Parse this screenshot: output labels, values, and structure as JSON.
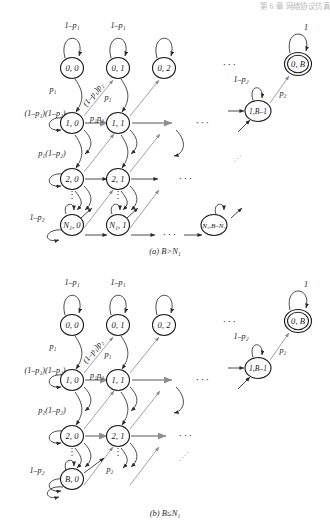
{
  "figure": {
    "header_text": "第 6 章   网络协议仿真",
    "type": "markov-chain-state-transition-diagram",
    "panels": [
      {
        "id": "a",
        "caption": "(a) B>N₁",
        "caption_plain": "(a) B>N1",
        "nodes": [
          {
            "id": "n00",
            "label": "0, 0",
            "kind": "normal"
          },
          {
            "id": "n01",
            "label": "0, 1",
            "kind": "normal"
          },
          {
            "id": "n02",
            "label": "0, 2",
            "kind": "normal"
          },
          {
            "id": "n10",
            "label": "1, 0",
            "kind": "normal"
          },
          {
            "id": "n11",
            "label": "1, 1",
            "kind": "normal"
          },
          {
            "id": "n20",
            "label": "2, 0",
            "kind": "normal"
          },
          {
            "id": "n21",
            "label": "2, 1",
            "kind": "normal"
          },
          {
            "id": "nN0",
            "label": "N₁, 0",
            "kind": "normal"
          },
          {
            "id": "nN1",
            "label": "N₁, 1",
            "kind": "normal"
          },
          {
            "id": "nNB",
            "label": "N₁,B–N₁",
            "kind": "normal"
          },
          {
            "id": "n0B",
            "label": "0, B",
            "kind": "absorbing"
          },
          {
            "id": "n1B",
            "label": "1,B–1",
            "kind": "normal"
          }
        ],
        "edge_labels": [
          {
            "id": "a-l1",
            "text": "1–p₁"
          },
          {
            "id": "a-l2",
            "text": "1–p₁"
          },
          {
            "id": "a-l3",
            "text": "p₁"
          },
          {
            "id": "a-l4",
            "text": "p₁"
          },
          {
            "id": "a-l5",
            "text": "(1–p₁)p₂"
          },
          {
            "id": "a-l6",
            "text": "(1–p₁)(1–p₂)"
          },
          {
            "id": "a-l7",
            "text": "p₁p₂"
          },
          {
            "id": "a-l8",
            "text": "p₁(1–p₂)"
          },
          {
            "id": "a-l9",
            "text": "1–p₂"
          },
          {
            "id": "a-l10",
            "text": "1"
          },
          {
            "id": "a-l11",
            "text": "1–p₂"
          },
          {
            "id": "a-l12",
            "text": "p₂"
          }
        ],
        "ellipses": [
          {
            "id": "a-e1",
            "text": "···"
          },
          {
            "id": "a-e2",
            "text": "···"
          },
          {
            "id": "a-e3",
            "text": "···"
          },
          {
            "id": "a-e4",
            "text": "···"
          },
          {
            "id": "a-e5",
            "text": "···"
          },
          {
            "id": "a-v1",
            "text": "⋮"
          },
          {
            "id": "a-v2",
            "text": "⋮"
          },
          {
            "id": "a-d1",
            "text": "···"
          }
        ]
      },
      {
        "id": "b",
        "caption": "(b) B≤N₁",
        "caption_plain": "(b) B<=N1",
        "nodes": [
          {
            "id": "m00",
            "label": "0, 0",
            "kind": "normal"
          },
          {
            "id": "m01",
            "label": "0, 1",
            "kind": "normal"
          },
          {
            "id": "m02",
            "label": "0, 2",
            "kind": "normal"
          },
          {
            "id": "m10",
            "label": "1, 0",
            "kind": "normal"
          },
          {
            "id": "m11",
            "label": "1, 1",
            "kind": "normal"
          },
          {
            "id": "m20",
            "label": "2, 0",
            "kind": "normal"
          },
          {
            "id": "m21",
            "label": "2, 1",
            "kind": "normal"
          },
          {
            "id": "mB0",
            "label": "B, 0",
            "kind": "normal"
          },
          {
            "id": "m0B",
            "label": "0, B",
            "kind": "absorbing"
          },
          {
            "id": "m1B",
            "label": "1,B–1",
            "kind": "normal"
          }
        ],
        "edge_labels": [
          {
            "id": "b-l1",
            "text": "1–p₁"
          },
          {
            "id": "b-l2",
            "text": "1–p₁"
          },
          {
            "id": "b-l3",
            "text": "p₁"
          },
          {
            "id": "b-l4",
            "text": "p₁"
          },
          {
            "id": "b-l5",
            "text": "(1–p₁)p₂"
          },
          {
            "id": "b-l6",
            "text": "(1–p₁)(1–p₂)"
          },
          {
            "id": "b-l7",
            "text": "p₁p₂"
          },
          {
            "id": "b-l8",
            "text": "p₁(1–p₂)"
          },
          {
            "id": "b-l9",
            "text": "1–p₂"
          },
          {
            "id": "b-l10",
            "text": "p₂"
          },
          {
            "id": "b-l11",
            "text": "1"
          },
          {
            "id": "b-l12",
            "text": "1–p₂"
          },
          {
            "id": "b-l13",
            "text": "p₂"
          }
        ],
        "ellipses": [
          {
            "id": "b-e1",
            "text": "···"
          },
          {
            "id": "b-e2",
            "text": "···"
          },
          {
            "id": "b-e3",
            "text": "···"
          },
          {
            "id": "b-v1",
            "text": "⋮"
          },
          {
            "id": "b-v2",
            "text": "⋮"
          },
          {
            "id": "b-d1",
            "text": "····"
          }
        ]
      }
    ]
  }
}
